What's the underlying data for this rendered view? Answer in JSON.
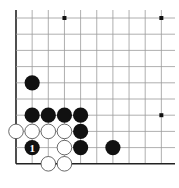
{
  "diagram": {
    "type": "go-board-fragment",
    "grid": {
      "origin_x": 16,
      "origin_y": 18,
      "spacing_x": 16.15,
      "spacing_y": 16.2,
      "cols": 11,
      "rows": 10,
      "left_edge": true,
      "bottom_edge": true,
      "line_color": "#9a9a9a",
      "edge_color": "#222222"
    },
    "hoshi": [
      {
        "col": 3,
        "row": 0
      },
      {
        "col": 9,
        "row": 0
      },
      {
        "col": 9,
        "row": 6
      }
    ],
    "stones": [
      {
        "color": "black",
        "col": 1,
        "row": 4
      },
      {
        "color": "black",
        "col": 1,
        "row": 6
      },
      {
        "color": "black",
        "col": 2,
        "row": 6
      },
      {
        "color": "black",
        "col": 3,
        "row": 6
      },
      {
        "color": "black",
        "col": 4,
        "row": 6
      },
      {
        "color": "black",
        "col": 4,
        "row": 7
      },
      {
        "color": "black",
        "col": 4,
        "row": 8
      },
      {
        "color": "black",
        "col": 6,
        "row": 8
      },
      {
        "color": "black",
        "col": 1,
        "row": 8,
        "label": "1"
      },
      {
        "color": "white",
        "col": 0,
        "row": 7
      },
      {
        "color": "white",
        "col": 1,
        "row": 7
      },
      {
        "color": "white",
        "col": 2,
        "row": 7
      },
      {
        "color": "white",
        "col": 3,
        "row": 7
      },
      {
        "color": "white",
        "col": 3,
        "row": 8
      },
      {
        "color": "white",
        "col": 2,
        "row": 9
      },
      {
        "color": "white",
        "col": 3,
        "row": 9
      }
    ],
    "colors": {
      "black_stone": "#111111",
      "white_stone": "#ffffff",
      "white_outline": "#444444",
      "label_on_black": "#ffffff"
    }
  }
}
